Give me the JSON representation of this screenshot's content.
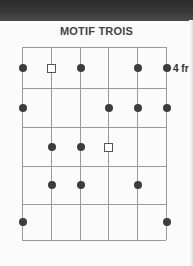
{
  "title": "MOTIF TROIS",
  "fret_label": "4 fr",
  "colors": {
    "topbar": "#333333",
    "grid": "#999999",
    "dot": "#3c3c3c"
  },
  "grid": {
    "strings": 6,
    "frets": 5,
    "x": [
      22,
      51,
      80,
      108,
      137,
      166
    ],
    "y": [
      47,
      88,
      127,
      166,
      204,
      240
    ]
  },
  "markers": [
    {
      "string": 1,
      "fret": 1,
      "type": "dot"
    },
    {
      "string": 2,
      "fret": 1,
      "type": "square"
    },
    {
      "string": 3,
      "fret": 1,
      "type": "dot"
    },
    {
      "string": 5,
      "fret": 1,
      "type": "dot"
    },
    {
      "string": 6,
      "fret": 1,
      "type": "dot"
    },
    {
      "string": 1,
      "fret": 2,
      "type": "dot"
    },
    {
      "string": 4,
      "fret": 2,
      "type": "dot"
    },
    {
      "string": 5,
      "fret": 2,
      "type": "dot"
    },
    {
      "string": 6,
      "fret": 2,
      "type": "dot"
    },
    {
      "string": 2,
      "fret": 3,
      "type": "dot"
    },
    {
      "string": 3,
      "fret": 3,
      "type": "dot"
    },
    {
      "string": 4,
      "fret": 3,
      "type": "square"
    },
    {
      "string": 2,
      "fret": 4,
      "type": "dot"
    },
    {
      "string": 3,
      "fret": 4,
      "type": "dot"
    },
    {
      "string": 5,
      "fret": 4,
      "type": "dot"
    },
    {
      "string": 1,
      "fret": 5,
      "type": "dot"
    },
    {
      "string": 6,
      "fret": 5,
      "type": "dot"
    }
  ]
}
